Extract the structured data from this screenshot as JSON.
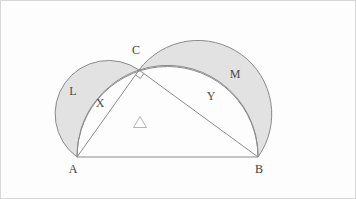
{
  "figure": {
    "background_color": "#fdfdfd",
    "shade_color": "#e2e2e2",
    "stroke_color": "#8a8a8a",
    "frame_color": "#d8d8d8",
    "vertices": [
      {
        "name": "A",
        "label": "A",
        "x": 77,
        "y": 157,
        "label_x": 73,
        "label_y": 170
      },
      {
        "name": "B",
        "label": "B",
        "x": 258,
        "y": 157,
        "label_x": 259,
        "label_y": 170
      },
      {
        "name": "C",
        "label": "C",
        "x": 139,
        "y": 70,
        "label_x": 136,
        "label_y": 51
      }
    ],
    "region_labels": [
      {
        "name": "lune-left",
        "label": "L",
        "x": 73,
        "y": 92
      },
      {
        "name": "segment-left",
        "label": "X",
        "x": 100,
        "y": 104
      },
      {
        "name": "lune-right",
        "label": "M",
        "x": 235,
        "y": 75
      },
      {
        "name": "segment-right",
        "label": "Y",
        "x": 211,
        "y": 97
      }
    ],
    "triangle_glyph": {
      "name": "triangle-glyph",
      "x": 140,
      "y": 122,
      "size": 13
    },
    "right_angle": {
      "name": "right-angle-marker",
      "x": 139,
      "y": 70,
      "size": 6
    },
    "frame": {
      "x": 0.5,
      "y": 0.5,
      "width": 355,
      "height": 198
    }
  },
  "chart_data": {
    "type": "diagram",
    "points": {
      "A": [
        77,
        157
      ],
      "B": [
        258,
        157
      ],
      "C": [
        139,
        70
      ]
    },
    "semicircles": [
      {
        "name": "hypotenuse-AB",
        "from": "A",
        "to": "B",
        "bulge": "up",
        "radius": 90.5
      },
      {
        "name": "leg-AC",
        "from": "A",
        "to": "C",
        "bulge": "outward-left",
        "radius": 52.4
      },
      {
        "name": "leg-BC",
        "from": "C",
        "to": "B",
        "bulge": "outward-right",
        "radius": 71.4
      }
    ],
    "shaded_regions": [
      "L",
      "M"
    ],
    "unshaded_regions": [
      "X",
      "Y",
      "triangle"
    ],
    "labels": [
      "A",
      "B",
      "C",
      "L",
      "M",
      "X",
      "Y"
    ]
  }
}
